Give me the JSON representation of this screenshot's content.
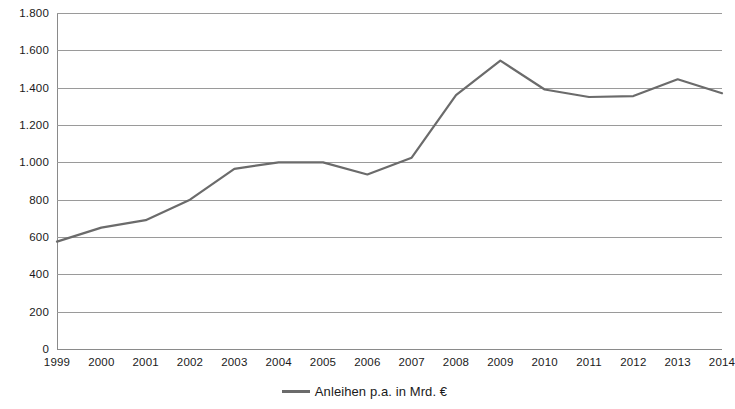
{
  "chart_data": {
    "type": "line",
    "title": "",
    "xlabel": "",
    "ylabel": "",
    "grid": true,
    "legend_position": "bottom-center",
    "series_color": "#6b6b6b",
    "x": [
      1999,
      2000,
      2001,
      2002,
      2003,
      2004,
      2005,
      2006,
      2007,
      2008,
      2009,
      2010,
      2011,
      2012,
      2013,
      2014
    ],
    "categories": [
      "1999",
      "2000",
      "2001",
      "2002",
      "2003",
      "2004",
      "2005",
      "2006",
      "2007",
      "2008",
      "2009",
      "2010",
      "2011",
      "2012",
      "2013",
      "2014"
    ],
    "series": [
      {
        "name": "Anleihen p.a. in Mrd. €",
        "values": [
          575,
          650,
          690,
          800,
          965,
          1000,
          1000,
          935,
          1025,
          1360,
          1545,
          1390,
          1350,
          1355,
          1445,
          1370
        ]
      }
    ],
    "ylim": [
      0,
      1800
    ],
    "yticks": [
      0,
      200,
      400,
      600,
      800,
      1000,
      1200,
      1400,
      1600,
      1800
    ],
    "ytick_labels": [
      "0",
      "200",
      "400",
      "600",
      "800",
      "1.000",
      "1.200",
      "1.400",
      "1.600",
      "1.800"
    ]
  },
  "legend": {
    "label": "Anleihen p.a. in Mrd. €"
  }
}
